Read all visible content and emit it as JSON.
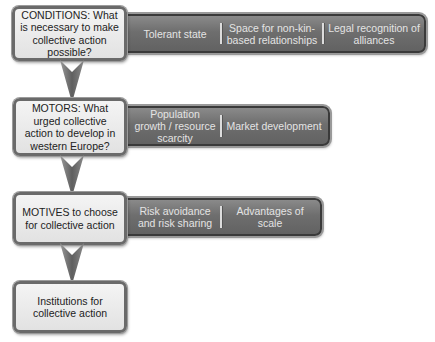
{
  "diagram": {
    "stages": [
      {
        "label": "CONDITIONS: What is necessary to make collective action possible?",
        "items": [
          "Tolerant state",
          "Space for non-kin-based relationships",
          "Legal recognition of alliances"
        ]
      },
      {
        "label": "MOTORS: What urged collective action to develop in western Europe?",
        "items": [
          "Population growth / resource scarcity",
          "Market development"
        ]
      },
      {
        "label": "MOTIVES to choose for collective action",
        "items": [
          "Risk avoidance and risk sharing",
          "Advantages of scale"
        ]
      },
      {
        "label": "Institutions for collective action",
        "items": []
      }
    ],
    "colors": {
      "box_fill": "#ececec",
      "box_border": "#6a6a6a",
      "bar_fill": "#707070",
      "bar_text": "#e4e4e4",
      "arrow": "#6f6f6f"
    }
  }
}
